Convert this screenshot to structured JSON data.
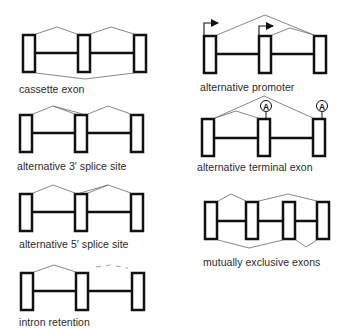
{
  "colors": {
    "exon_stroke": "#111111",
    "splice_line": "#6a6a6a",
    "background": "#ffffff"
  },
  "panels": [
    {
      "id": "cassette",
      "label": "cassette exon"
    },
    {
      "id": "alt3",
      "label": "alternative 3′ splice site"
    },
    {
      "id": "alt5",
      "label": "alternative 5′ splice site"
    },
    {
      "id": "intron",
      "label": "intron retention"
    },
    {
      "id": "promoter",
      "label": "alternative promoter"
    },
    {
      "id": "terminal",
      "label": "alternative terminal exon",
      "polyA_marker": "A"
    },
    {
      "id": "mutex",
      "label": "mutually exclusive exons"
    }
  ]
}
